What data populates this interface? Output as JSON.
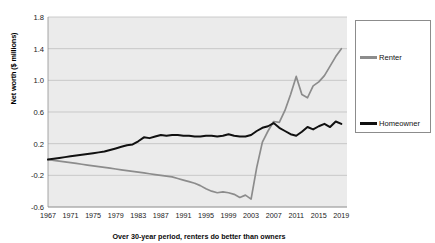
{
  "chart_data": {
    "type": "line",
    "title": "",
    "xlabel": "",
    "ylabel": "Net worth ($ millions)",
    "ylim": [
      -0.6,
      1.8
    ],
    "xlim": [
      1967,
      2020
    ],
    "yticks": [
      "1.8",
      "1.4",
      "1.0",
      "0.6",
      "0.2",
      "-0.2",
      "-0.6"
    ],
    "ytick_values": [
      1.8,
      1.4,
      1.0,
      0.6,
      0.2,
      -0.2,
      -0.6
    ],
    "xticks": [
      "1967",
      "1971",
      "1975",
      "1979",
      "1983",
      "1987",
      "1991",
      "1995",
      "1999",
      "2003",
      "2007",
      "2011",
      "2015",
      "2019"
    ],
    "xtick_values": [
      1967,
      1971,
      1975,
      1979,
      1983,
      1987,
      1991,
      1995,
      1999,
      2003,
      2007,
      2011,
      2015,
      2019
    ],
    "grid": true,
    "legend_position": "right",
    "x": [
      1967,
      1968,
      1969,
      1970,
      1971,
      1972,
      1973,
      1974,
      1975,
      1976,
      1977,
      1978,
      1979,
      1980,
      1981,
      1982,
      1983,
      1984,
      1985,
      1986,
      1987,
      1988,
      1989,
      1990,
      1991,
      1992,
      1993,
      1994,
      1995,
      1996,
      1997,
      1998,
      1999,
      2000,
      2001,
      2002,
      2003,
      2004,
      2005,
      2006,
      2007,
      2008,
      2009,
      2010,
      2011,
      2012,
      2013,
      2014,
      2015,
      2016,
      2017,
      2018,
      2019
    ],
    "series": [
      {
        "name": "Renter",
        "color": "#8c8c8c",
        "values": [
          0.0,
          -0.01,
          -0.02,
          -0.03,
          -0.04,
          -0.05,
          -0.06,
          -0.07,
          -0.08,
          -0.09,
          -0.1,
          -0.11,
          -0.12,
          -0.13,
          -0.14,
          -0.15,
          -0.16,
          -0.17,
          -0.18,
          -0.19,
          -0.2,
          -0.21,
          -0.22,
          -0.24,
          -0.26,
          -0.28,
          -0.3,
          -0.33,
          -0.37,
          -0.4,
          -0.42,
          -0.41,
          -0.42,
          -0.44,
          -0.48,
          -0.45,
          -0.5,
          -0.1,
          0.22,
          0.36,
          0.48,
          0.47,
          0.62,
          0.82,
          1.05,
          0.82,
          0.78,
          0.93,
          0.98,
          1.06,
          1.18,
          1.3,
          1.4
        ]
      },
      {
        "name": "Homeowner",
        "color": "#101010",
        "values": [
          0.0,
          0.01,
          0.02,
          0.03,
          0.04,
          0.05,
          0.06,
          0.07,
          0.08,
          0.09,
          0.1,
          0.12,
          0.14,
          0.16,
          0.18,
          0.19,
          0.23,
          0.28,
          0.27,
          0.29,
          0.31,
          0.3,
          0.31,
          0.31,
          0.3,
          0.3,
          0.29,
          0.29,
          0.3,
          0.3,
          0.29,
          0.3,
          0.32,
          0.3,
          0.29,
          0.29,
          0.31,
          0.36,
          0.4,
          0.42,
          0.46,
          0.4,
          0.36,
          0.32,
          0.3,
          0.35,
          0.41,
          0.38,
          0.42,
          0.45,
          0.41,
          0.48,
          0.45
        ]
      }
    ]
  },
  "legend": {
    "entries": [
      {
        "label": "Renter",
        "color": "#8c8c8c"
      },
      {
        "label": "Homeowner",
        "color": "#101010"
      }
    ]
  },
  "caption": {
    "text": "Over 30-year period, renters do better than owners"
  }
}
